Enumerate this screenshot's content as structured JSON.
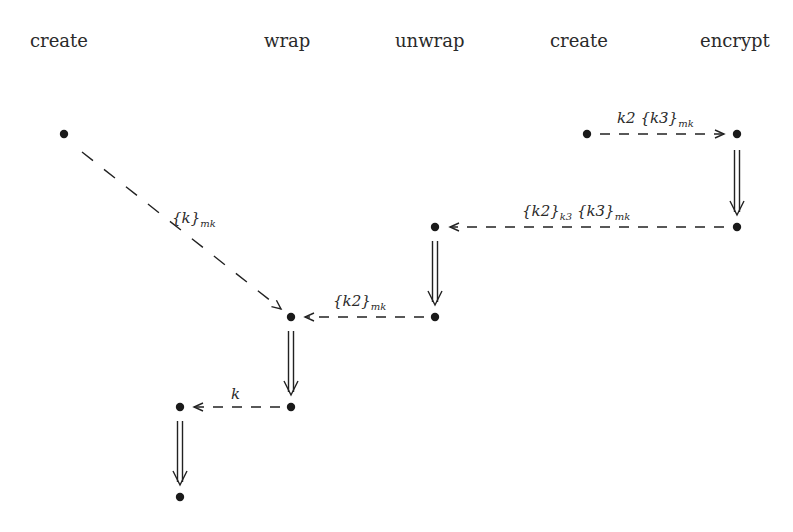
{
  "columns": [
    {
      "label": "create",
      "x": 30
    },
    {
      "label": "wrap",
      "x": 264
    },
    {
      "label": "unwrap",
      "x": 395
    },
    {
      "label": "create",
      "x": 550
    },
    {
      "label": "encrypt",
      "x": 700
    }
  ],
  "nodes": [
    {
      "id": "n1",
      "x": 64,
      "y": 134
    },
    {
      "id": "n2",
      "x": 587,
      "y": 134
    },
    {
      "id": "n3",
      "x": 737,
      "y": 134
    },
    {
      "id": "n4",
      "x": 737,
      "y": 227
    },
    {
      "id": "n5",
      "x": 435,
      "y": 227
    },
    {
      "id": "n6",
      "x": 435,
      "y": 317
    },
    {
      "id": "n7",
      "x": 291,
      "y": 317
    },
    {
      "id": "n8",
      "x": 291,
      "y": 407
    },
    {
      "id": "n9",
      "x": 180,
      "y": 407
    },
    {
      "id": "n10",
      "x": 180,
      "y": 497
    }
  ],
  "messages": [
    {
      "from": "n1",
      "to": "n7",
      "label_main": "{k}",
      "label_sub": "mk"
    },
    {
      "from": "n2",
      "to": "n3",
      "label_prefix": "k2 ",
      "label_main": "{k3}",
      "label_sub": "mk"
    },
    {
      "from": "n4",
      "to": "n5",
      "label_main": "{k2}",
      "label_sub": "k3",
      "label_main2": " {k3}",
      "label_sub2": "mk"
    },
    {
      "from": "n6",
      "to": "n7",
      "label_main": "{k2}",
      "label_sub": "mk"
    },
    {
      "from": "n8",
      "to": "n9",
      "label_main": "k"
    }
  ],
  "transitions": [
    {
      "from": "n3",
      "to": "n4"
    },
    {
      "from": "n5",
      "to": "n6"
    },
    {
      "from": "n7",
      "to": "n8"
    },
    {
      "from": "n9",
      "to": "n10"
    }
  ],
  "labels": {
    "m1": {
      "main": "{k}",
      "sub": "mk"
    },
    "m2": {
      "prefix": "k2",
      "main": "{k3}",
      "sub": "mk"
    },
    "m3": {
      "main1": "{k2}",
      "sub1": "k3",
      "main2": "{k3}",
      "sub2": "mk"
    },
    "m4": {
      "main": "{k2}",
      "sub": "mk"
    },
    "m5": {
      "main": "k"
    }
  },
  "colors": {
    "ink": "#222222",
    "background": "#ffffff"
  }
}
